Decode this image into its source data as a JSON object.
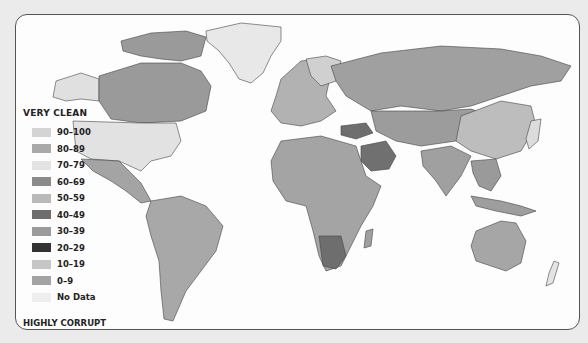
{
  "map": {
    "type": "choropleth-world",
    "legend": {
      "top_label": "VERY CLEAN",
      "bottom_label": "HIGHLY CORRUPT",
      "items": [
        {
          "label": "90–100",
          "color": "#d4d4d4"
        },
        {
          "label": "80–89",
          "color": "#a9a9a9"
        },
        {
          "label": "70–79",
          "color": "#e3e3e3"
        },
        {
          "label": "60–69",
          "color": "#8a8a8a"
        },
        {
          "label": "50–59",
          "color": "#b9b9b9"
        },
        {
          "label": "40–49",
          "color": "#6e6e6e"
        },
        {
          "label": "30–39",
          "color": "#9b9b9b"
        },
        {
          "label": "20–29",
          "color": "#333333"
        },
        {
          "label": "10–19",
          "color": "#c6c6c6"
        },
        {
          "label": "0–9",
          "color": "#a3a3a3"
        },
        {
          "label": "No Data",
          "color": "#eeeeee"
        }
      ]
    },
    "colors": {
      "background": "#ebebeb",
      "ocean": "#fdfdfd",
      "border": "#555555"
    }
  }
}
